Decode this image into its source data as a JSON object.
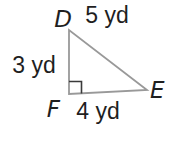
{
  "figure": {
    "type": "right-triangle",
    "unit": "yd",
    "vertices": {
      "top": {
        "label": "D"
      },
      "right": {
        "label": "E"
      },
      "bottom_left": {
        "label": "F"
      }
    },
    "sides": {
      "hypotenuse": {
        "from": "D",
        "to": "E",
        "label": "5 yd",
        "value": 5
      },
      "left": {
        "from": "D",
        "to": "F",
        "label": "3 yd",
        "value": 3
      },
      "bottom": {
        "from": "F",
        "to": "E",
        "label": "4 yd",
        "value": 4
      }
    },
    "right_angle_at": "F",
    "colors": {
      "line": "#999999",
      "text": "#1f1f1f",
      "background": "#ffffff"
    }
  }
}
